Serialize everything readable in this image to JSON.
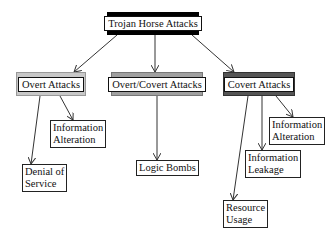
{
  "root": {
    "label": "Trojan Horse Attacks",
    "fill": "#000000"
  },
  "categories": [
    {
      "label": "Overt Attacks",
      "fill": "#c8c8c8"
    },
    {
      "label": "Overt/Covert Attacks",
      "fill": "#a0a0a0"
    },
    {
      "label": "Covert Attacks",
      "fill": "#555555"
    }
  ],
  "leaves": {
    "overt": [
      {
        "line1": "Information",
        "line2": "Alteration"
      },
      {
        "line1": "Denial of",
        "line2": "Service"
      }
    ],
    "overt_covert": [
      {
        "line1": "Logic Bombs"
      }
    ],
    "covert": [
      {
        "line1": "Information",
        "line2": "Alteration"
      },
      {
        "line1": "Information",
        "line2": "Leakage"
      },
      {
        "line1": "Resource",
        "line2": "Usage"
      }
    ]
  }
}
